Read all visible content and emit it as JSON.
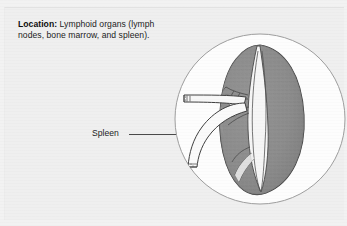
{
  "figure": {
    "panel_background": "#efefef",
    "caption": {
      "lead_label": "Location:",
      "body_text": " Lymphoid organs (lymph nodes, bone marrow, and spleen)."
    },
    "callout": {
      "label": "Spleen",
      "leader_line": "horizontal-leader-line"
    },
    "inset": {
      "shape": "circle",
      "subject": "spleen-anatomical-illustration",
      "parts": [
        "splenic-capsule",
        "splenic-parenchyma",
        "splenic-hilum",
        "splenic-artery",
        "splenic-vein",
        "trabecular-vessel-branches"
      ],
      "colors": {
        "tissue_fill": "#8e8e8e",
        "tissue_shadow": "#6e6e6e",
        "tissue_light": "#f4f4f4",
        "outline": "#3d3d3d",
        "circle_outline": "#9a9a9a",
        "circle_fill": "#fdfdfd"
      }
    }
  }
}
